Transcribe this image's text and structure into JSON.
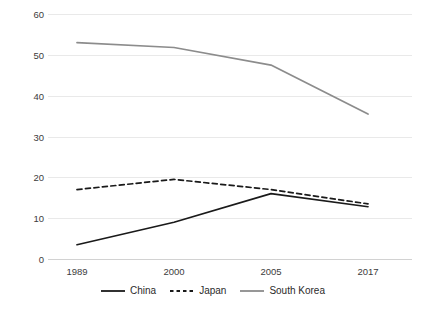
{
  "chart_data": {
    "type": "line",
    "title": "",
    "subtitle": "",
    "xlabel": "",
    "ylabel": "",
    "categories": [
      "1989",
      "2000",
      "2005",
      "2017"
    ],
    "ylim": [
      0,
      60
    ],
    "yticks": [
      0,
      10,
      20,
      30,
      40,
      50,
      60
    ],
    "ytick_labels": [
      "0",
      "10",
      "20",
      "30",
      "40",
      "50",
      "60"
    ],
    "grid": true,
    "legend_position": "bottom",
    "series": [
      {
        "name": "China",
        "values": [
          3.5,
          9.0,
          16.0,
          12.8
        ],
        "color": "#1a1a1a",
        "style": "solid"
      },
      {
        "name": "Japan",
        "values": [
          17.0,
          19.5,
          17.0,
          13.5
        ],
        "color": "#1a1a1a",
        "style": "dashed"
      },
      {
        "name": "South Korea",
        "values": [
          53.0,
          51.8,
          47.5,
          35.5
        ],
        "color": "#8c8c8c",
        "style": "solid"
      }
    ]
  },
  "axis": {
    "y_labels": [
      "60",
      "50",
      "40",
      "30",
      "20",
      "10",
      "0"
    ],
    "x_labels": [
      "1989",
      "2000",
      "2005",
      "2017"
    ]
  },
  "legend": {
    "items": [
      {
        "label": "China"
      },
      {
        "label": "Japan"
      },
      {
        "label": "South Korea"
      }
    ]
  },
  "colors": {
    "gridline": "#e9e9e9",
    "axis": "#d2d2d2",
    "text": "#3c3c3c",
    "china": "#1a1a1a",
    "japan": "#1a1a1a",
    "south_korea": "#8c8c8c",
    "background": "#ffffff"
  }
}
